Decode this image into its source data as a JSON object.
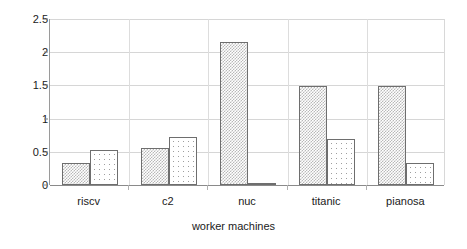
{
  "chart_data": {
    "type": "bar",
    "title": "",
    "subtitle": "",
    "xlabel": "worker machines",
    "ylabel": "",
    "categories": [
      "riscv",
      "c2",
      "nuc",
      "titanic",
      "pianosa"
    ],
    "series": [
      {
        "name": "series-1",
        "values": [
          0.33,
          0.56,
          2.16,
          1.49,
          1.49
        ]
      },
      {
        "name": "series-2",
        "values": [
          0.53,
          0.72,
          0.03,
          0.7,
          0.33
        ]
      }
    ],
    "ylim": [
      0,
      2.5
    ],
    "yticks": [
      0,
      0.5,
      1,
      1.5,
      2,
      2.5
    ],
    "ytick_labels": [
      "0",
      "0.5",
      "1",
      "1.5",
      "2",
      "2.5"
    ],
    "grid": true,
    "grid_axis": "y",
    "legend": false,
    "legend_position": "none",
    "bar_patterns": [
      "dense-checkerboard",
      "sparse-dots"
    ],
    "colors": {
      "bar_edge": "#6e6e6e",
      "bar_fill": "#ffffff",
      "pattern_dark": "#b8b8b8",
      "pattern_light": "#9e9e9e",
      "gridline": "#d6d6d6",
      "axis": "#8a8a8a",
      "text": "#1a1a1a",
      "background": "#ffffff"
    }
  },
  "axes": {
    "x_title": "worker machines"
  }
}
